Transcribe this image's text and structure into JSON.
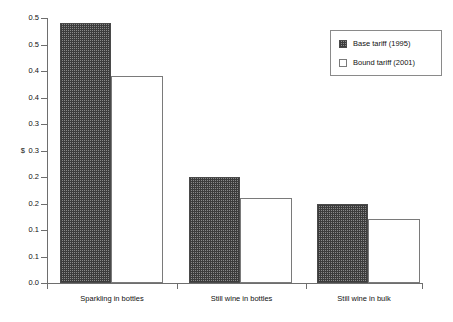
{
  "chart_data": {
    "type": "bar",
    "title": "",
    "subtitle": "",
    "xlabel": "",
    "ylabel": "$",
    "categories": [
      "Sparkling in bottles",
      "Still wine in bottles",
      "Still wine in bulk"
    ],
    "series": [
      {
        "name": "Base tariff (1995)",
        "values": [
          0.49,
          0.2,
          0.15
        ],
        "fill": "checkered",
        "color": "#3c3c3c"
      },
      {
        "name": "Bound tariff (2001)",
        "values": [
          0.39,
          0.16,
          0.12
        ],
        "fill": "white",
        "color": "#ffffff"
      }
    ],
    "ylim": [
      0.0,
      0.5
    ],
    "ytick_step": 0.05,
    "ytick_values": [
      0.5,
      0.45,
      0.4,
      0.35,
      0.3,
      0.25,
      0.2,
      0.15,
      0.1,
      0.05,
      0.0
    ],
    "ytick_labels": [
      "0.5",
      "0.5",
      "0.4",
      "0.4",
      "0.3",
      "0.3",
      "0.2",
      "0.2",
      "0.1",
      "0.1",
      "0.0"
    ],
    "grid": false,
    "legend_position": "top-right",
    "axis_unit_symbol": "$",
    "axis_unit_at_tick": "0.3"
  },
  "legend": {
    "items": [
      {
        "label": "Base tariff (1995)"
      },
      {
        "label": "Bound tariff (2001)"
      }
    ]
  },
  "yaxis": {
    "ticks": [
      {
        "label": "0.5"
      },
      {
        "label": "0.5"
      },
      {
        "label": "0.4"
      },
      {
        "label": "0.4"
      },
      {
        "label": "0.3"
      },
      {
        "label": "0.3"
      },
      {
        "label": "0.2"
      },
      {
        "label": "0.2"
      },
      {
        "label": "0.1"
      },
      {
        "label": "0.1"
      },
      {
        "label": "0.0"
      }
    ],
    "unit": "$"
  },
  "xaxis": {
    "categories": [
      {
        "label": "Sparkling in bottles"
      },
      {
        "label": "Still wine in bottles"
      },
      {
        "label": "Still wine in bulk"
      }
    ]
  }
}
